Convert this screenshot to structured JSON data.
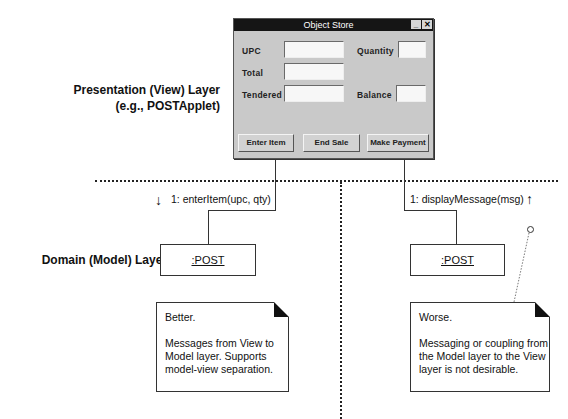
{
  "layers": {
    "presentation": {
      "line1": "Presentation (View) Layer",
      "line2": "(e.g., POSTApplet)"
    },
    "domain": {
      "label": "Domain (Model) Layer"
    }
  },
  "window": {
    "title": "Object Store",
    "minimize_glyph": "_",
    "close_glyph": "✕",
    "fields": {
      "upc": {
        "label": "UPC",
        "value": ""
      },
      "quantity": {
        "label": "Quantity",
        "value": ""
      },
      "total": {
        "label": "Total",
        "value": ""
      },
      "tendered": {
        "label": "Tendered",
        "value": ""
      },
      "balance": {
        "label": "Balance",
        "value": ""
      }
    },
    "buttons": {
      "enter_item": "Enter Item",
      "end_sale": "End Sale",
      "make_payment": "Make Payment"
    }
  },
  "messages": {
    "left": {
      "text": "1: enterItem(upc, qty)",
      "arrow": "↓"
    },
    "right": {
      "text": "1: displayMessage(msg)",
      "arrow": "↑"
    }
  },
  "objects": {
    "left": ":POST",
    "right": ":POST"
  },
  "notes": {
    "left": {
      "title": "Better.",
      "body": "Messages from View to Model layer. Supports model-view separation."
    },
    "right": {
      "title": "Worse.",
      "body": "Messaging or coupling from the Model layer to the View layer is not desirable."
    }
  }
}
